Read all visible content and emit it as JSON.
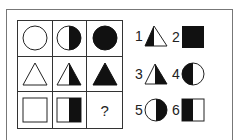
{
  "puzzle": {
    "grid": [
      [
        {
          "shape": "circle",
          "fill": "empty"
        },
        {
          "shape": "circle",
          "fill": "right-half"
        },
        {
          "shape": "circle",
          "fill": "full"
        }
      ],
      [
        {
          "shape": "triangle",
          "fill": "empty"
        },
        {
          "shape": "triangle",
          "fill": "right-half"
        },
        {
          "shape": "triangle",
          "fill": "full"
        }
      ],
      [
        {
          "shape": "square",
          "fill": "empty"
        },
        {
          "shape": "square",
          "fill": "right-half"
        },
        {
          "shape": "unknown",
          "label": "?"
        }
      ]
    ],
    "question_mark": "?",
    "options": [
      {
        "number": "1",
        "shape": "triangle",
        "fill": "left-half"
      },
      {
        "number": "2",
        "shape": "square",
        "fill": "full"
      },
      {
        "number": "3",
        "shape": "triangle",
        "fill": "right-half"
      },
      {
        "number": "4",
        "shape": "circle",
        "fill": "left-half"
      },
      {
        "number": "5",
        "shape": "circle",
        "fill": "right-half"
      },
      {
        "number": "6",
        "shape": "square",
        "fill": "left-half"
      }
    ]
  },
  "colors": {
    "ink": "#111111",
    "line": "#333333",
    "background": "#ffffff"
  }
}
